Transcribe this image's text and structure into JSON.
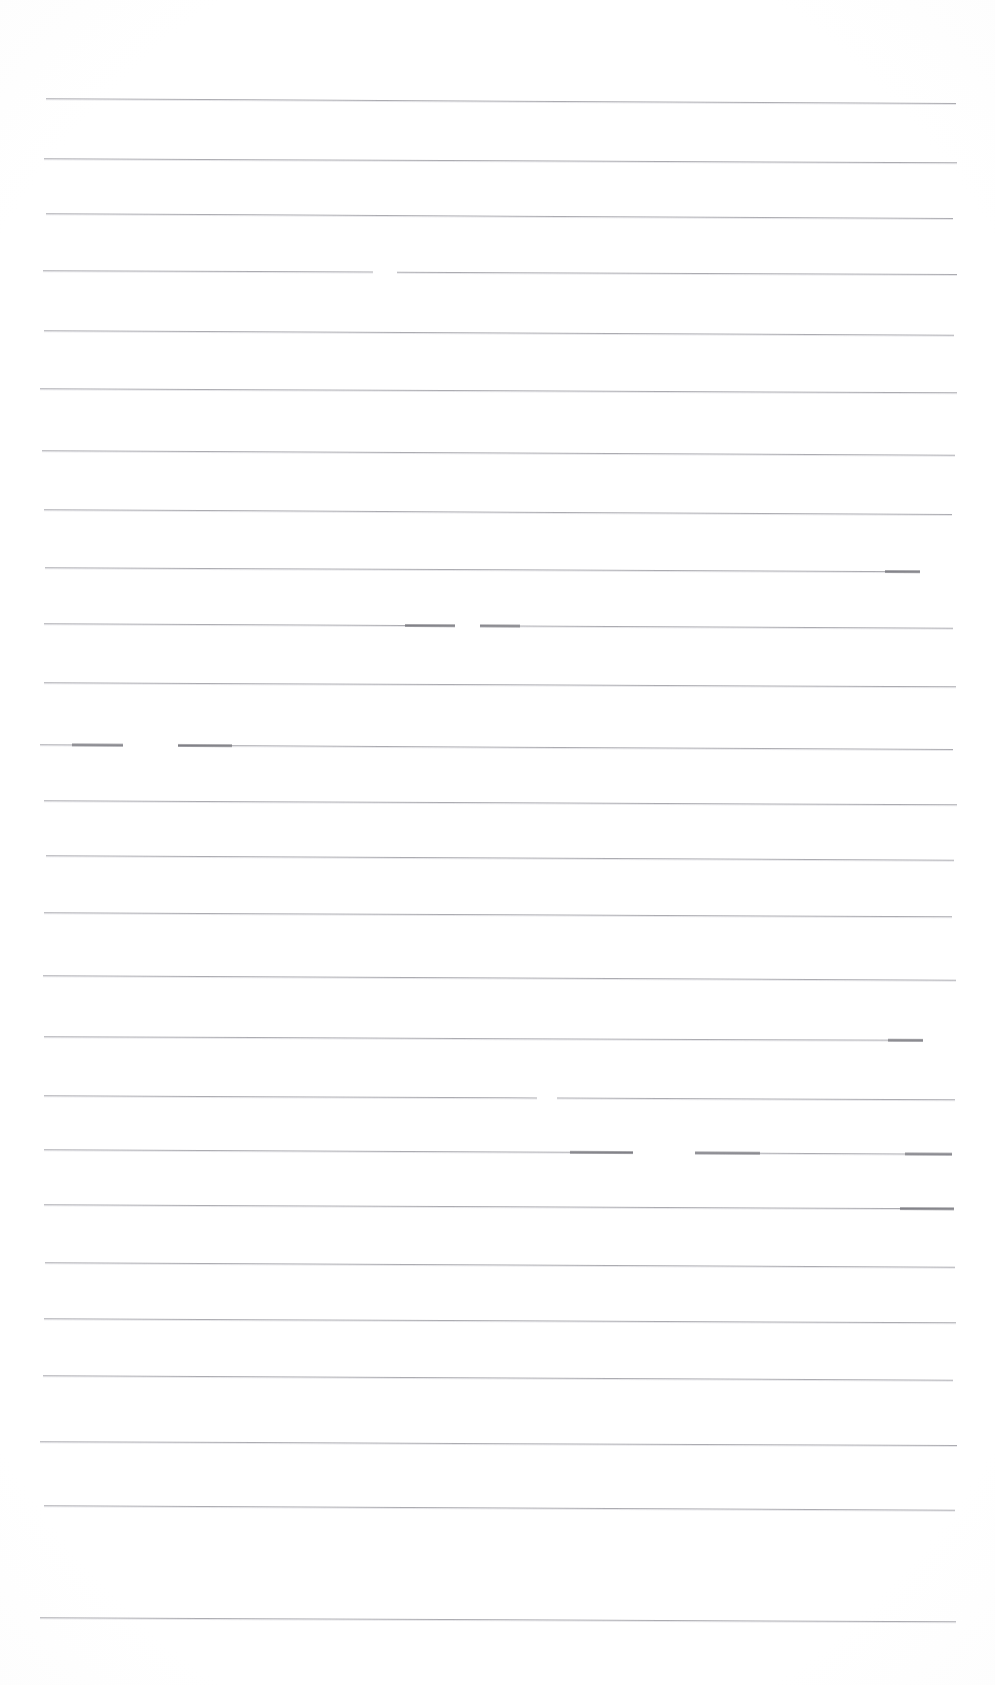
{
  "document": {
    "kind": "scanned-ruled-page",
    "title": "Blank lined page",
    "page_width": 995,
    "page_height": 1685,
    "background_color": "#ffffff",
    "rule_color": "#8d8d94",
    "rule_highlight_color": "#b9b9c0",
    "smudge_color": "#5d5d64",
    "rule_count": 26,
    "top_margin": 98,
    "bottom_margin": 70,
    "left_margin": 44,
    "right_margin": 40,
    "average_line_spacing": 60,
    "skew_degrees": 0.28,
    "visible_text": "",
    "notes": "No typed or handwritten text is present; only horizontal ruled lines with scan artifacts."
  },
  "rules": [
    {
      "id": 1,
      "y": 98,
      "skew": 0.3,
      "segments": [
        [
          46,
          956
        ]
      ],
      "smudges": []
    },
    {
      "id": 2,
      "y": 158,
      "skew": 0.26,
      "segments": [
        [
          44,
          957
        ]
      ],
      "smudges": []
    },
    {
      "id": 3,
      "y": 213,
      "skew": 0.3,
      "segments": [
        [
          46,
          953
        ]
      ],
      "smudges": []
    },
    {
      "id": 4,
      "y": 270,
      "skew": 0.24,
      "segments": [
        [
          43,
          373
        ],
        [
          397,
          957
        ]
      ],
      "smudges": []
    },
    {
      "id": 5,
      "y": 330,
      "skew": 0.28,
      "segments": [
        [
          44,
          954
        ]
      ],
      "smudges": []
    },
    {
      "id": 6,
      "y": 388,
      "skew": 0.26,
      "segments": [
        [
          40,
          957
        ]
      ],
      "smudges": []
    },
    {
      "id": 7,
      "y": 450,
      "skew": 0.28,
      "segments": [
        [
          42,
          955
        ]
      ],
      "smudges": []
    },
    {
      "id": 8,
      "y": 509,
      "skew": 0.3,
      "segments": [
        [
          44,
          952
        ]
      ],
      "smudges": []
    },
    {
      "id": 9,
      "y": 567,
      "skew": 0.26,
      "segments": [
        [
          45,
          920
        ]
      ],
      "smudges": [
        [
          885,
          920
        ]
      ]
    },
    {
      "id": 10,
      "y": 623,
      "skew": 0.28,
      "segments": [
        [
          44,
          455
        ],
        [
          480,
          953
        ]
      ],
      "smudges": [
        [
          405,
          455
        ],
        [
          480,
          520
        ]
      ]
    },
    {
      "id": 11,
      "y": 682,
      "skew": 0.26,
      "segments": [
        [
          44,
          956
        ]
      ],
      "smudges": []
    },
    {
      "id": 12,
      "y": 744,
      "skew": 0.3,
      "segments": [
        [
          40,
          123
        ],
        [
          178,
          953
        ]
      ],
      "smudges": [
        [
          72,
          123
        ],
        [
          178,
          232
        ]
      ]
    },
    {
      "id": 13,
      "y": 800,
      "skew": 0.26,
      "segments": [
        [
          44,
          957
        ]
      ],
      "smudges": []
    },
    {
      "id": 14,
      "y": 855,
      "skew": 0.28,
      "segments": [
        [
          46,
          954
        ]
      ],
      "smudges": []
    },
    {
      "id": 15,
      "y": 912,
      "skew": 0.26,
      "segments": [
        [
          44,
          952
        ]
      ],
      "smudges": []
    },
    {
      "id": 16,
      "y": 975,
      "skew": 0.28,
      "segments": [
        [
          43,
          956
        ]
      ],
      "smudges": []
    },
    {
      "id": 17,
      "y": 1036,
      "skew": 0.24,
      "segments": [
        [
          44,
          923
        ]
      ],
      "smudges": [
        [
          888,
          923
        ]
      ]
    },
    {
      "id": 18,
      "y": 1095,
      "skew": 0.26,
      "segments": [
        [
          44,
          537
        ],
        [
          557,
          955
        ]
      ],
      "smudges": []
    },
    {
      "id": 19,
      "y": 1149,
      "skew": 0.28,
      "segments": [
        [
          44,
          633
        ],
        [
          695,
          952
        ]
      ],
      "smudges": [
        [
          570,
          633
        ],
        [
          695,
          760
        ],
        [
          905,
          952
        ]
      ]
    },
    {
      "id": 20,
      "y": 1204,
      "skew": 0.26,
      "segments": [
        [
          44,
          954
        ]
      ],
      "smudges": [
        [
          900,
          954
        ]
      ]
    },
    {
      "id": 21,
      "y": 1262,
      "skew": 0.28,
      "segments": [
        [
          45,
          955
        ]
      ],
      "smudges": []
    },
    {
      "id": 22,
      "y": 1318,
      "skew": 0.26,
      "segments": [
        [
          44,
          956
        ]
      ],
      "smudges": []
    },
    {
      "id": 23,
      "y": 1375,
      "skew": 0.28,
      "segments": [
        [
          43,
          953
        ]
      ],
      "smudges": []
    },
    {
      "id": 24,
      "y": 1441,
      "skew": 0.24,
      "segments": [
        [
          40,
          957
        ]
      ],
      "smudges": []
    },
    {
      "id": 25,
      "y": 1505,
      "skew": 0.28,
      "segments": [
        [
          44,
          955
        ]
      ],
      "smudges": []
    },
    {
      "id": 26,
      "y": 1617,
      "skew": 0.26,
      "segments": [
        [
          40,
          956
        ]
      ],
      "smudges": []
    }
  ]
}
